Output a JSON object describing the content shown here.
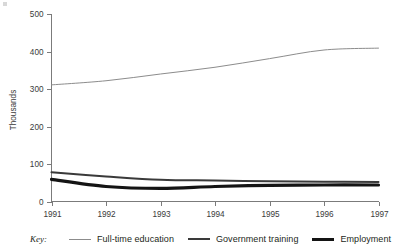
{
  "chart_data": {
    "type": "line",
    "title": "",
    "xlabel": "",
    "ylabel": "Thousands",
    "x": [
      1991,
      1992,
      1993,
      1994,
      1995,
      1996,
      1997
    ],
    "categories": [
      "1991",
      "1992",
      "1993",
      "1994",
      "1995",
      "1996",
      "1997"
    ],
    "xlim": [
      1991,
      1997
    ],
    "ylim": [
      0,
      500
    ],
    "yticks": [
      0,
      100,
      200,
      300,
      400,
      500
    ],
    "ytick_labels": [
      "0",
      "100",
      "200",
      "300",
      "400",
      "500"
    ],
    "xtick_labels": [
      "1991",
      "1992",
      "1993",
      "1994",
      "1995",
      "1996",
      "1997"
    ],
    "grid": false,
    "legend_position": "bottom",
    "legend_title": "Key:",
    "series": [
      {
        "name": "Full-time education",
        "color": "#8c8c8c",
        "stroke_width": 1,
        "values": [
          311,
          322,
          340,
          358,
          381,
          404,
          409
        ]
      },
      {
        "name": "Government training",
        "color": "#3a3a3a",
        "stroke_width": 2,
        "values": [
          78,
          67,
          58,
          56,
          54,
          53,
          52
        ]
      },
      {
        "name": "Employment",
        "color": "#141414",
        "stroke_width": 3.2,
        "values": [
          59,
          40,
          35,
          40,
          43,
          44,
          44
        ]
      }
    ]
  },
  "axes": {
    "y_axis_title": "Thousands",
    "y_tick_labels": [
      "500",
      "400",
      "300",
      "200",
      "100",
      "0"
    ],
    "x_tick_labels": [
      "1991",
      "1992",
      "1993",
      "1994",
      "1995",
      "1996",
      "1997"
    ]
  },
  "legend": {
    "key_label": "Key:",
    "entries": [
      {
        "label": "Full-time education",
        "color": "#8c8c8c",
        "width": 1
      },
      {
        "label": "Government training",
        "color": "#3a3a3a",
        "width": 2
      },
      {
        "label": "Employment",
        "color": "#141414",
        "width": 3.2
      }
    ]
  }
}
